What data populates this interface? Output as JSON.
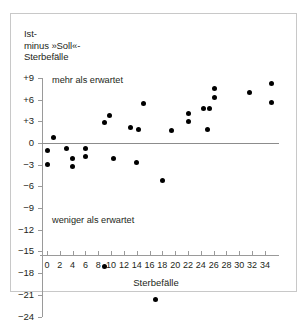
{
  "figure": {
    "background_color": "#ffffff",
    "frame_color": "#c8c8c8",
    "axis_color": "#9a9a9a",
    "marker_color": "#000000"
  },
  "y_axis_title": "Ist-\nminus »Soll«-\nSterbefälle",
  "x_axis_title": "Sterbefälle",
  "annotations": {
    "above": "mehr als erwartet",
    "below": "weniger als erwartet"
  },
  "y_ticks": [
    "+9",
    "+6",
    "+3",
    "0",
    "−3",
    "−6",
    "−9",
    "−12",
    "−15",
    "−18",
    "−21",
    "−24"
  ],
  "y_tick_values": [
    9,
    6,
    3,
    0,
    -3,
    -6,
    -9,
    -12,
    -15,
    -18,
    -21,
    -24
  ],
  "x_ticks": [
    "0",
    "2",
    "4",
    "6",
    "8",
    "10",
    "12",
    "14",
    "16",
    "18",
    "20",
    "22",
    "24",
    "26",
    "28",
    "30",
    "32",
    "34"
  ],
  "x_tick_values": [
    0,
    2,
    4,
    6,
    8,
    10,
    12,
    14,
    16,
    18,
    20,
    22,
    24,
    26,
    28,
    30,
    32,
    34
  ],
  "chart_data": {
    "type": "scatter",
    "title": "",
    "xlabel": "Sterbefälle",
    "ylabel": "Ist- minus »Soll«- Sterbefälle",
    "xlim": [
      -1,
      36
    ],
    "ylim": [
      -25,
      10
    ],
    "grid": false,
    "legend": null,
    "reference_line": {
      "y": 0,
      "color": "#8c8c8c"
    },
    "annotations": [
      {
        "text": "mehr als erwartet",
        "x": 1,
        "y": 8.4
      },
      {
        "text": "weniger als erwartet",
        "x": 1,
        "y": -21.0
      }
    ],
    "points": [
      {
        "x": 0,
        "y": -1.0
      },
      {
        "x": 0,
        "y": -3.0
      },
      {
        "x": 1,
        "y": 0.8
      },
      {
        "x": 3,
        "y": -0.8
      },
      {
        "x": 4,
        "y": -2.2
      },
      {
        "x": 4,
        "y": -3.3
      },
      {
        "x": 6,
        "y": -0.7
      },
      {
        "x": 6,
        "y": -1.8
      },
      {
        "x": 9,
        "y": 2.9
      },
      {
        "x": 9,
        "y": -17.1
      },
      {
        "x": 9.7,
        "y": 3.8
      },
      {
        "x": 10.3,
        "y": -2.1
      },
      {
        "x": 13,
        "y": 2.2
      },
      {
        "x": 14.2,
        "y": 1.8
      },
      {
        "x": 14,
        "y": -2.7
      },
      {
        "x": 15,
        "y": 5.5
      },
      {
        "x": 17,
        "y": -21.6
      },
      {
        "x": 18,
        "y": -5.2
      },
      {
        "x": 19.4,
        "y": 1.7
      },
      {
        "x": 22,
        "y": 4.1
      },
      {
        "x": 22,
        "y": 3.0
      },
      {
        "x": 24.4,
        "y": 4.8
      },
      {
        "x": 25.3,
        "y": 4.8
      },
      {
        "x": 25,
        "y": 1.8
      },
      {
        "x": 26.2,
        "y": 7.5
      },
      {
        "x": 26.2,
        "y": 6.3
      },
      {
        "x": 31.6,
        "y": 7.0
      },
      {
        "x": 35,
        "y": 8.2
      },
      {
        "x": 35,
        "y": 5.6
      }
    ]
  }
}
